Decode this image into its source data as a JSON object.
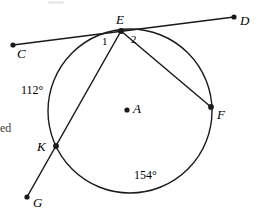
{
  "figure": {
    "type": "circle-geometry-diagram",
    "stroke_color": "#1a1a1a",
    "background_color": "#ffffff",
    "circle": {
      "cx": 130,
      "cy": 111,
      "r": 82
    }
  },
  "points": [
    {
      "id": "C",
      "label": "C",
      "x": 13,
      "y": 45,
      "label_x": 17,
      "label_y": 47,
      "on_circle": false
    },
    {
      "id": "D",
      "label": "D",
      "x": 234,
      "y": 17,
      "label_x": 240,
      "label_y": 14,
      "on_circle": false
    },
    {
      "id": "E",
      "label": "E",
      "x": 121,
      "y": 31,
      "label_x": 116,
      "label_y": 13,
      "on_circle": true
    },
    {
      "id": "A",
      "label": "A",
      "x": 127,
      "y": 110,
      "label_x": 133,
      "label_y": 102,
      "on_circle": false
    },
    {
      "id": "F",
      "label": "F",
      "x": 211,
      "y": 107,
      "label_x": 217,
      "label_y": 108,
      "on_circle": true
    },
    {
      "id": "K",
      "label": "K",
      "x": 56,
      "y": 146,
      "label_x": 37,
      "label_y": 140,
      "on_circle": true
    },
    {
      "id": "G",
      "label": "G",
      "x": 27,
      "y": 197,
      "label_x": 33,
      "label_y": 196,
      "on_circle": false
    }
  ],
  "segments": [
    {
      "id": "line-CD",
      "name": "secant-line-c-e-d",
      "from": "C",
      "to": "D",
      "through": "E"
    },
    {
      "id": "line-GE",
      "name": "secant-line-g-k-e",
      "from": "G",
      "to": "E",
      "through": "K"
    },
    {
      "id": "chord-EF",
      "name": "chord-e-f",
      "from": "E",
      "to": "F"
    }
  ],
  "angle_labels": [
    {
      "id": "angle-1",
      "label": "1",
      "x": 102,
      "y": 36
    },
    {
      "id": "angle-2",
      "label": "2",
      "x": 131,
      "y": 34
    }
  ],
  "arc_labels": [
    {
      "id": "arc-EK",
      "label": "112°",
      "x": 21,
      "y": 84
    },
    {
      "id": "arc-KF",
      "label": "154°",
      "x": 134,
      "y": 169
    }
  ],
  "margin_text": {
    "left_fragment": "ed",
    "x": 0,
    "y": 122
  }
}
